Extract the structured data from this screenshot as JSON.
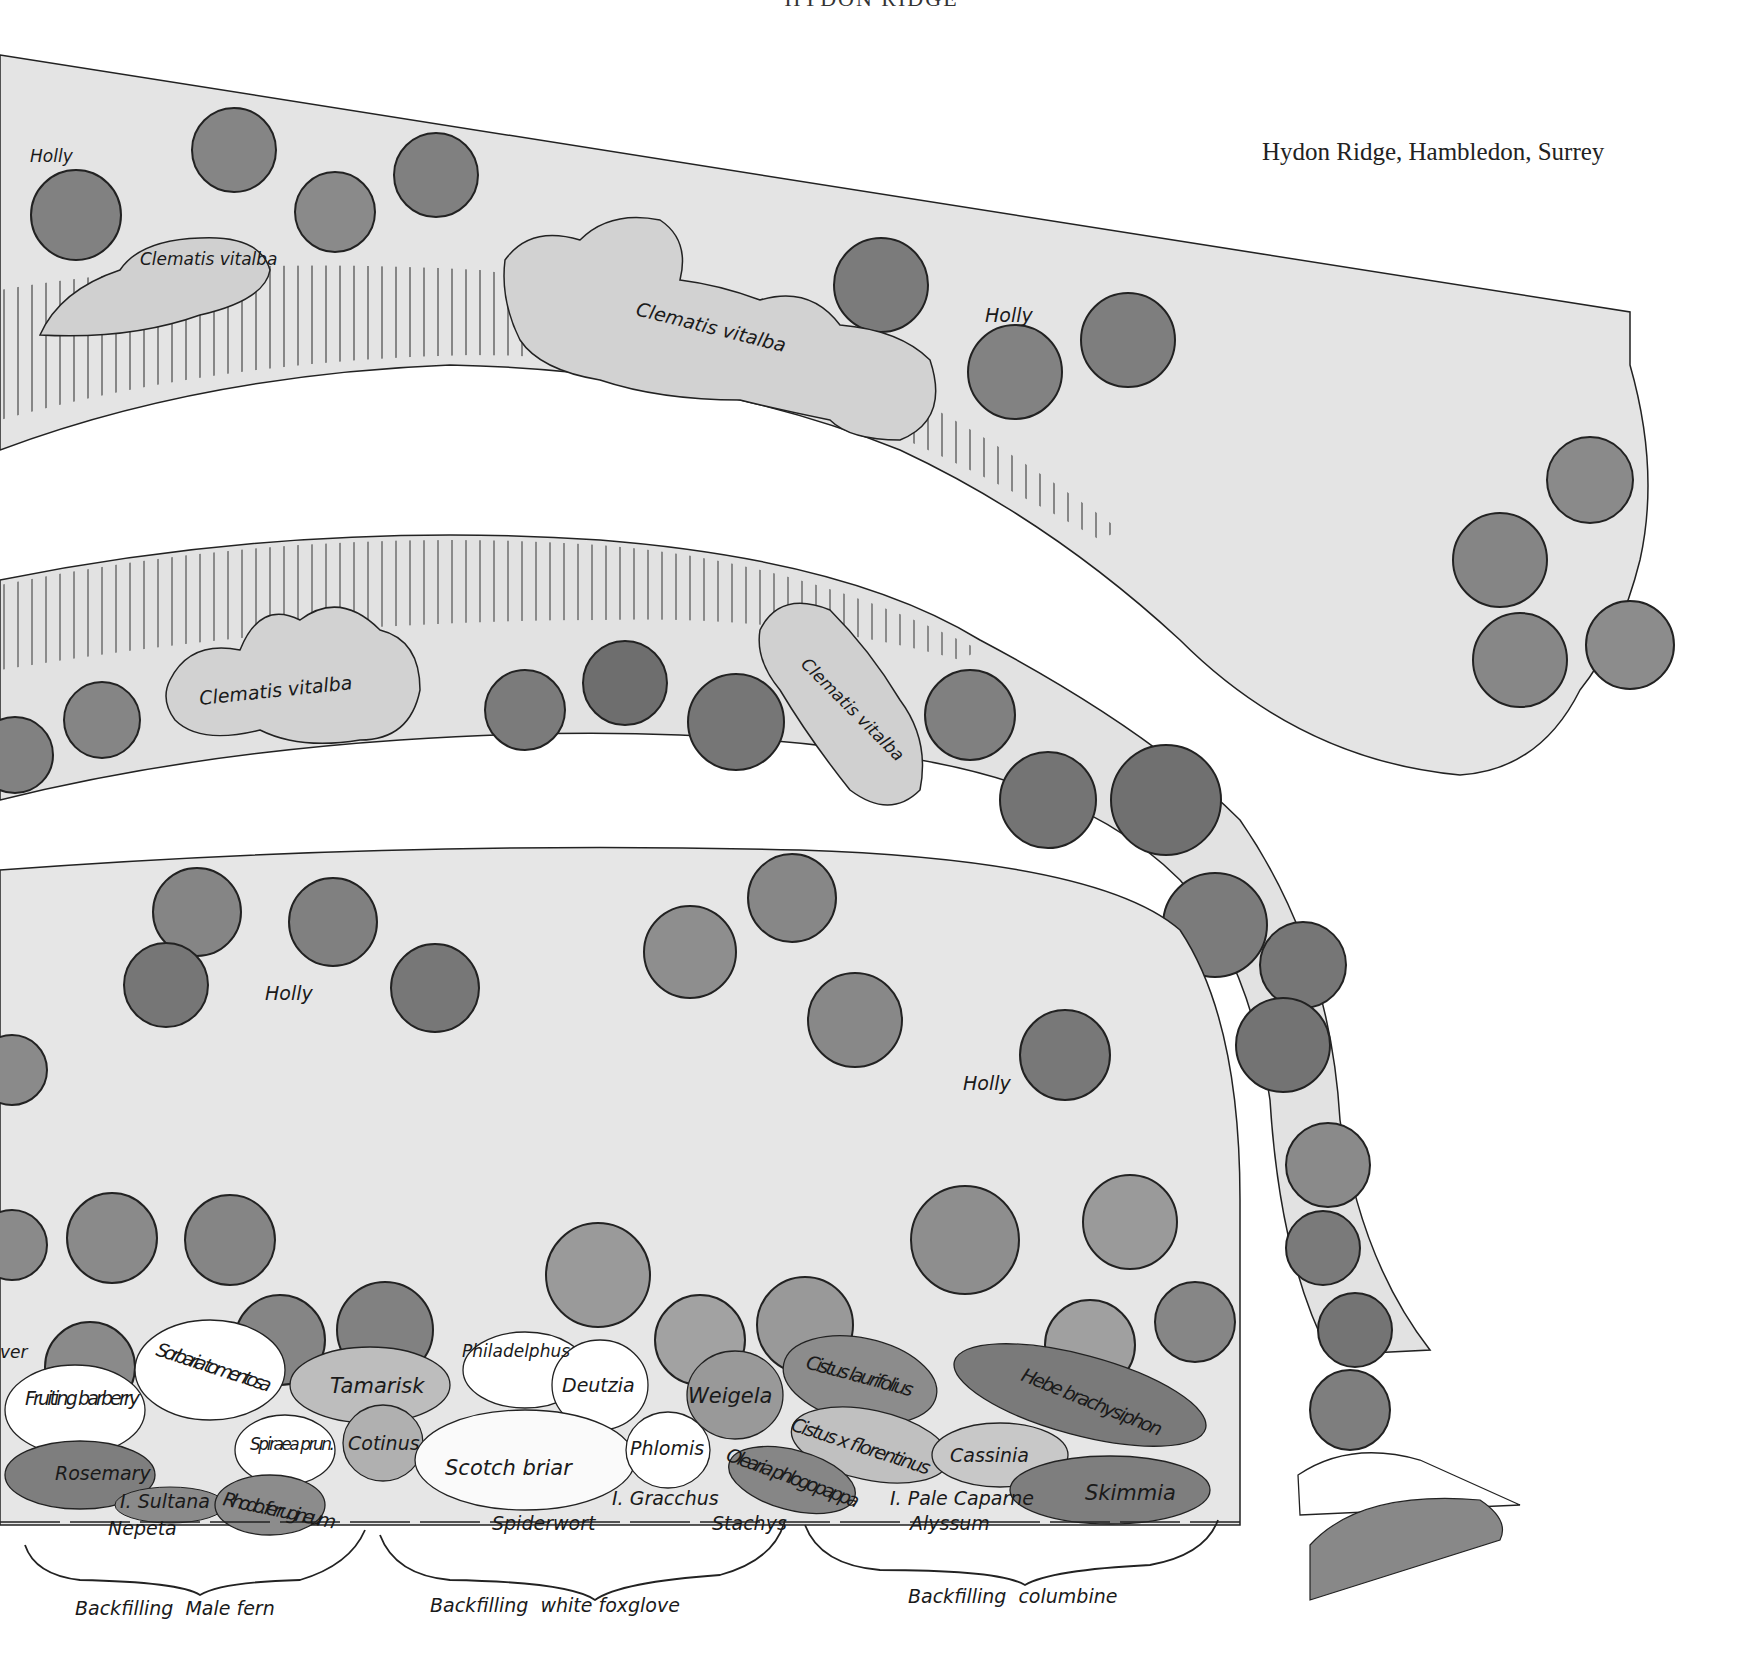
{
  "header": {
    "title": "HYDON RIDGE"
  },
  "caption": "Hydon Ridge, Hambledon, Surrey",
  "colors": {
    "background": "#ffffff",
    "bed_wash": "#e4e4e4",
    "holly_dark": "#7a7a7a",
    "holly_mid": "#8e8e8e",
    "clematis": "#d2d2d2",
    "shrub_light": "#f7f7f7",
    "shrub_mid": "#b5b5b5",
    "shrub_dark": "#838383",
    "ink": "#1a1a1a"
  },
  "upper_bed": {
    "labels": {
      "holly_left": "Holly",
      "clematis_left": "Clematis vitalba",
      "clematis_center": "Clematis vitalba",
      "holly_right": "Holly"
    }
  },
  "middle_bed": {
    "labels": {
      "clematis_left": "Clematis vitalba",
      "clematis_right": "Clematis vitalba"
    }
  },
  "lower_bed": {
    "labels": {
      "holly_left": "Holly",
      "holly_right": "Holly"
    }
  },
  "shrub_border": {
    "edge_fragment": "…ver / …ver",
    "plants": {
      "fruiting_barberry": "Fruiting barberry",
      "sorbaria": "Sorbaria tomentosa",
      "tamarisk": "Tamarisk",
      "philadelphus": "Philadelphus",
      "deutzia": "Deutzia",
      "weigela": "Weigela",
      "cistus_laurifolius": "Cistus laurifolius",
      "hebe": "Hebe brachysiphon",
      "spiraea": "Spiraea prun.",
      "cotinus": "Cotinus",
      "scotch_briar": "Scotch briar",
      "phlomis": "Phlomis",
      "cistus_florentinus": "Cistus x florentinus",
      "cassinia": "Cassinia",
      "rosemary": "Rosemary",
      "iris_sultana": "I. Sultana",
      "rhodo": "Rhodo. ferrugineum",
      "iris_gracchus": "I. Gracchus",
      "olearia": "Olearia phlogopappa",
      "iris_pale_caparne": "I. Pale Caparne",
      "skimmia": "Skimmia"
    },
    "edging": {
      "nepeta": "Nepeta",
      "spiderwort": "Spiderwort",
      "stachys": "Stachys",
      "alyssum": "Alyssum"
    },
    "backfilling": [
      {
        "label": "Backfilling  Male fern"
      },
      {
        "label": "Backfilling  white foxglove"
      },
      {
        "label": "Backfilling  columbine"
      }
    ]
  }
}
